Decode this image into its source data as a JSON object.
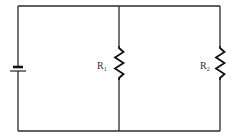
{
  "diagram": {
    "type": "circuit",
    "components": [
      {
        "id": "battery",
        "kind": "battery",
        "label": ""
      },
      {
        "id": "R1",
        "kind": "resistor",
        "label": "R",
        "subscript": "1"
      },
      {
        "id": "R2",
        "kind": "resistor",
        "label": "R",
        "subscript": "2"
      }
    ],
    "topology": "parallel",
    "colors": {
      "wire": "#2b2b2b",
      "background": "#ffffff"
    }
  }
}
